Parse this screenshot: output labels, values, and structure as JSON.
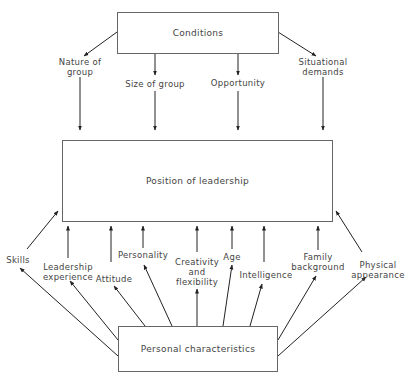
{
  "boxes": {
    "conditions": "Conditions",
    "position": "Position of leadership",
    "personal": "Personal characteristics"
  },
  "conditions": [
    {
      "label": "Nature of\ngroup"
    },
    {
      "label": "Size of group"
    },
    {
      "label": "Opportunity"
    },
    {
      "label": "Situational\ndemands"
    }
  ],
  "characteristics": [
    {
      "label": "Skills"
    },
    {
      "label": "Leadership\nexperience"
    },
    {
      "label": "Attitude"
    },
    {
      "label": "Personality"
    },
    {
      "label": "Creativity\nand\nflexibility"
    },
    {
      "label": "Age"
    },
    {
      "label": "Intelligence"
    },
    {
      "label": "Family\nbackground"
    },
    {
      "label": "Physical\nappearance"
    }
  ]
}
